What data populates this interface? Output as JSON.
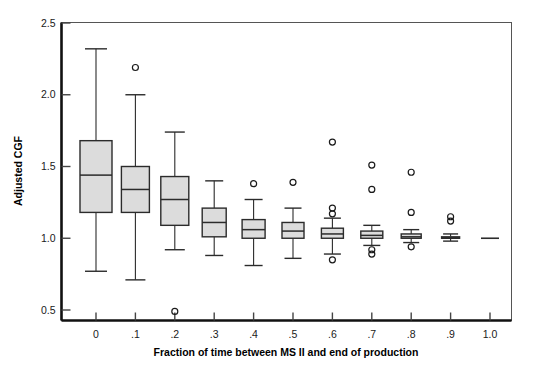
{
  "chart_data": {
    "type": "box",
    "title": "",
    "xlabel": "Fraction of time between MS II and end of production",
    "ylabel": "Adjusted CGF",
    "xlim": [
      -0.05,
      1.1
    ],
    "ylim": [
      0.42,
      2.5
    ],
    "grid": false,
    "legend": null,
    "x_tick_labels": [
      "0",
      ".1",
      ".2",
      ".3",
      ".4",
      ".5",
      ".6",
      ".7",
      ".8",
      ".9",
      "1.0"
    ],
    "y_tick_labels": [
      "0.5",
      "1.0",
      "1.5",
      "2.0",
      "2.5"
    ],
    "y_ticks": [
      0.5,
      1.0,
      1.5,
      2.0,
      2.5
    ],
    "x_ticks": [
      0,
      0.1,
      0.2,
      0.3,
      0.4,
      0.5,
      0.6,
      0.7,
      0.8,
      0.9,
      1.0
    ],
    "box_fill": "#dcdcdc",
    "box_stroke": "#2b2b2b",
    "boxes": [
      {
        "category": "0",
        "x": 0,
        "whisker_low": 0.77,
        "q1": 1.18,
        "median": 1.44,
        "q3": 1.68,
        "whisker_high": 2.32,
        "outliers": []
      },
      {
        "category": ".1",
        "x": 0.1,
        "whisker_low": 0.71,
        "q1": 1.18,
        "median": 1.34,
        "q3": 1.5,
        "whisker_high": 2.0,
        "outliers": [
          2.19
        ]
      },
      {
        "category": ".2",
        "x": 0.2,
        "whisker_low": 0.92,
        "q1": 1.09,
        "median": 1.27,
        "q3": 1.43,
        "whisker_high": 1.74,
        "outliers": [
          0.49
        ]
      },
      {
        "category": ".3",
        "x": 0.3,
        "whisker_low": 0.88,
        "q1": 1.01,
        "median": 1.11,
        "q3": 1.21,
        "whisker_high": 1.4,
        "outliers": []
      },
      {
        "category": ".4",
        "x": 0.4,
        "whisker_low": 0.81,
        "q1": 1.0,
        "median": 1.06,
        "q3": 1.13,
        "whisker_high": 1.27,
        "outliers": [
          1.38
        ]
      },
      {
        "category": ".5",
        "x": 0.5,
        "whisker_low": 0.86,
        "q1": 1.0,
        "median": 1.05,
        "q3": 1.11,
        "whisker_high": 1.21,
        "outliers": [
          1.39
        ]
      },
      {
        "category": ".6",
        "x": 0.6,
        "whisker_low": 0.89,
        "q1": 1.0,
        "median": 1.03,
        "q3": 1.07,
        "whisker_high": 1.14,
        "outliers": [
          1.67,
          1.21,
          1.17,
          0.85
        ]
      },
      {
        "category": ".7",
        "x": 0.7,
        "whisker_low": 0.95,
        "q1": 1.0,
        "median": 1.02,
        "q3": 1.05,
        "whisker_high": 1.09,
        "outliers": [
          1.51,
          1.34,
          0.92,
          0.89
        ]
      },
      {
        "category": ".8",
        "x": 0.8,
        "whisker_low": 0.97,
        "q1": 1.0,
        "median": 1.01,
        "q3": 1.03,
        "whisker_high": 1.06,
        "outliers": [
          1.46,
          1.18,
          0.94
        ]
      },
      {
        "category": ".9",
        "x": 0.9,
        "whisker_low": 0.98,
        "q1": 1.0,
        "median": 1.0,
        "q3": 1.01,
        "whisker_high": 1.03,
        "outliers": [
          1.15,
          1.12
        ]
      },
      {
        "category": "1.0",
        "x": 1.0,
        "whisker_low": 1.0,
        "q1": 1.0,
        "median": 1.0,
        "q3": 1.0,
        "whisker_high": 1.0,
        "outliers": []
      }
    ]
  }
}
